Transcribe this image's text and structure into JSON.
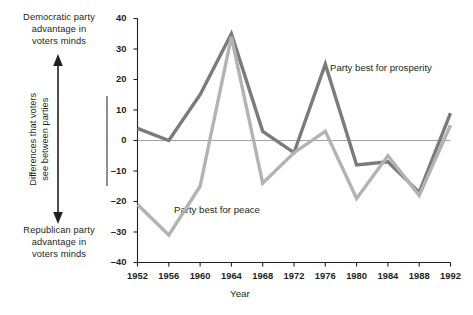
{
  "annotations": {
    "democratic_top": "Democratic party advantage in voters minds",
    "democratic_l1": "Democratic party",
    "democratic_l2": "advantage in",
    "democratic_l3": "voters minds",
    "republican_l1": "Republican party",
    "republican_l2": "advantage in",
    "republican_l3": "voters minds",
    "axis_bracket_l1": "Differences that voters",
    "axis_bracket_l2": "see between parties",
    "arrow_icon": "double-headed-vertical-arrow"
  },
  "chart_data": {
    "type": "line",
    "title": "",
    "xlabel": "Year",
    "ylabel": "",
    "x": [
      1952,
      1956,
      1960,
      1964,
      1968,
      1972,
      1976,
      1980,
      1984,
      1988,
      1992
    ],
    "categories": [
      "1952",
      "1956",
      "1960",
      "1964",
      "1968",
      "1972",
      "1976",
      "1980",
      "1984",
      "1988",
      "1992"
    ],
    "xlim": [
      1952,
      1992
    ],
    "ylim": [
      -40,
      40
    ],
    "yticks": [
      40,
      30,
      20,
      10,
      0,
      -10,
      -20,
      -30,
      -40
    ],
    "ytick_labels": [
      "40",
      "30",
      "20",
      "10",
      "0",
      "-10",
      "-20",
      "-30",
      "-40"
    ],
    "grid": false,
    "zero_line": true,
    "legend": "inline-labels",
    "series": [
      {
        "name": "Party best for prosperity",
        "color": "#7b7b7b",
        "values": [
          4,
          0,
          15,
          35,
          3,
          -4,
          25,
          -8,
          -7,
          -17,
          9
        ]
      },
      {
        "name": "Party best for peace",
        "color": "#b3b3b3",
        "values": [
          -21,
          -31,
          -15,
          34,
          -14,
          -4,
          3,
          -19,
          -5,
          -18,
          5
        ]
      }
    ]
  },
  "colors": {
    "prosperity": "#7b7b7b",
    "peace": "#b3b3b3",
    "axis": "#231f20",
    "zero_line": "#8c8c8c",
    "text": "#231f20"
  }
}
